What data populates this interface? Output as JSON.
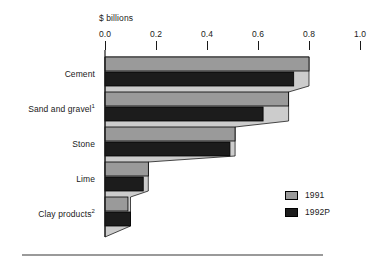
{
  "chart_data": {
    "type": "bar",
    "orientation": "horizontal",
    "title": "",
    "xlabel": "$ billions",
    "ylabel": "",
    "xlim": [
      0.0,
      1.0
    ],
    "xticks": [
      0.0,
      0.2,
      0.4,
      0.6,
      0.8,
      1.0
    ],
    "xticklabels": [
      "0.0",
      "0.2",
      "0.4",
      "0.6",
      "0.8",
      "1.0"
    ],
    "axis_position": "top",
    "grid": false,
    "categories": [
      "Cement",
      "Sand and gravel",
      "Stone",
      "Lime",
      "Clay products"
    ],
    "category_footnotes": [
      "",
      "1",
      "",
      "",
      "2"
    ],
    "series": [
      {
        "name": "1991",
        "color": "#9a9a9a",
        "values": [
          0.8,
          0.72,
          0.51,
          0.17,
          0.09
        ]
      },
      {
        "name": "1992P",
        "color": "#1c1c1c",
        "values": [
          0.74,
          0.62,
          0.49,
          0.15,
          0.1
        ]
      }
    ],
    "legend": {
      "position": "bottom-right",
      "entries": [
        {
          "label": "1991",
          "swatch": "#9a9a9a"
        },
        {
          "label": "1992P",
          "swatch": "#1c1c1c"
        }
      ]
    },
    "backdrop_polygon": {
      "description": "light-gray staircase wedge connecting bar ends, tapering to the axis origin",
      "color": "#cccccc"
    }
  },
  "axis": {
    "title": "$ billions",
    "ticks": [
      {
        "label": "0.0",
        "value": 0.0
      },
      {
        "label": "0.2",
        "value": 0.2
      },
      {
        "label": "0.4",
        "value": 0.4
      },
      {
        "label": "0.6",
        "value": 0.6
      },
      {
        "label": "0.8",
        "value": 0.8
      },
      {
        "label": "1.0",
        "value": 1.0
      }
    ]
  },
  "categories": [
    {
      "label": "Cement",
      "footnote": ""
    },
    {
      "label": "Sand and gravel",
      "footnote": "1"
    },
    {
      "label": "Stone",
      "footnote": ""
    },
    {
      "label": "Lime",
      "footnote": ""
    },
    {
      "label": "Clay products",
      "footnote": "2"
    }
  ],
  "legend": {
    "entries": [
      {
        "label": "1991"
      },
      {
        "label": "1992P"
      }
    ]
  },
  "colors": {
    "series_1991": "#9a9a9a",
    "series_1992": "#1c1c1c",
    "backdrop": "#cccccc",
    "rule": "#9a9a9a",
    "ink": "#1a1a1a"
  }
}
